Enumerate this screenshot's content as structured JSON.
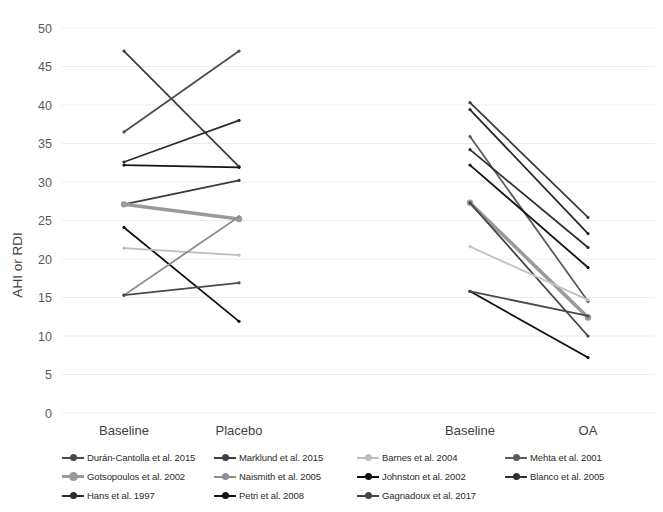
{
  "chart_data": {
    "type": "line",
    "title": "",
    "xlabel": "",
    "ylabel": "AHI or RDI",
    "ylim": [
      0,
      50
    ],
    "yticks": [
      0,
      5,
      10,
      15,
      20,
      25,
      30,
      35,
      40,
      45,
      50
    ],
    "grid": true,
    "legend_position": "bottom",
    "categories": [
      "Baseline",
      "Placebo",
      "Baseline",
      "OA"
    ],
    "groups": [
      {
        "name": "Placebo comparison",
        "x_labels": [
          "Baseline",
          "Placebo"
        ],
        "series": [
          {
            "name": "Hans et al. 1997",
            "values": [
              47.0,
              32.0
            ],
            "color": "#3f3f3f",
            "width": 1.8,
            "marker": 3.2
          },
          {
            "name": "Marklund et al. 2015",
            "values": [
              36.5,
              47.0
            ],
            "color": "#4d4d4d",
            "width": 1.8,
            "marker": 3.2
          },
          {
            "name": "Mehta et al. 2001",
            "values": [
              32.6,
              38.0
            ],
            "color": "#2e2e2e",
            "width": 1.8,
            "marker": 3.2
          },
          {
            "name": "Petri et al. 2008",
            "values": [
              32.2,
              31.9
            ],
            "color": "#151515",
            "width": 1.8,
            "marker": 3.2
          },
          {
            "name": "Blanco et al. 2005",
            "values": [
              27.1,
              30.2
            ],
            "color": "#3a3a3a",
            "width": 1.8,
            "marker": 3.2
          },
          {
            "name": "Gotsopoulos et al. 2002",
            "values": [
              27.1,
              25.2
            ],
            "color": "#9a9a9a",
            "width": 3.6,
            "marker": 6.4
          },
          {
            "name": "Johnston et al. 2002",
            "values": [
              24.1,
              11.9
            ],
            "color": "#101010",
            "width": 1.8,
            "marker": 3.2
          },
          {
            "name": "Barnes et al. 2004",
            "values": [
              21.4,
              20.5
            ],
            "color": "#bdbdbd",
            "width": 1.8,
            "marker": 3.2
          },
          {
            "name": "Naismith et al. 2005",
            "values": [
              15.3,
              25.5
            ],
            "color": "#8e8e8e",
            "width": 1.8,
            "marker": 3.2
          },
          {
            "name": "Durán-Cantolla et al. 2015",
            "values": [
              15.3,
              16.9
            ],
            "color": "#4a4a4a",
            "width": 1.8,
            "marker": 3.2
          }
        ]
      },
      {
        "name": "Oral appliance comparison",
        "x_labels": [
          "Baseline",
          "OA"
        ],
        "series": [
          {
            "name": "Marklund et al. 2015",
            "values": [
              40.3,
              25.4
            ],
            "color": "#3f3f3f",
            "width": 1.8,
            "marker": 3.2
          },
          {
            "name": "Hans et al. 1997",
            "values": [
              39.4,
              23.3
            ],
            "color": "#2b2b2b",
            "width": 1.8,
            "marker": 3.2
          },
          {
            "name": "Mehta et al. 2001",
            "values": [
              35.9,
              14.5
            ],
            "color": "#5c5c5c",
            "width": 1.8,
            "marker": 3.2
          },
          {
            "name": "Blanco et al. 2005",
            "values": [
              34.2,
              21.5
            ],
            "color": "#303030",
            "width": 1.8,
            "marker": 3.2
          },
          {
            "name": "Petri et al. 2008",
            "values": [
              32.2,
              18.9
            ],
            "color": "#151515",
            "width": 1.8,
            "marker": 3.2
          },
          {
            "name": "Gotsopoulos et al. 2002",
            "values": [
              27.3,
              12.4
            ],
            "color": "#9a9a9a",
            "width": 3.6,
            "marker": 6.4
          },
          {
            "name": "Gagnadoux et al. 2017",
            "values": [
              27.3,
              10.0
            ],
            "color": "#454545",
            "width": 1.8,
            "marker": 3.2
          },
          {
            "name": "Barnes et al. 2004",
            "values": [
              21.6,
              14.7
            ],
            "color": "#c2c2c2",
            "width": 1.8,
            "marker": 3.2
          },
          {
            "name": "Johnston et al. 2002",
            "values": [
              15.8,
              7.2
            ],
            "color": "#101010",
            "width": 1.8,
            "marker": 3.2
          },
          {
            "name": "Durán-Cantolla et al. 2015",
            "values": [
              15.8,
              12.6
            ],
            "color": "#4a4a4a",
            "width": 1.8,
            "marker": 3.2
          }
        ]
      }
    ]
  },
  "axis": {
    "y_title": "AHI or RDI",
    "y_tick_labels": [
      "50",
      "45",
      "40",
      "35",
      "30",
      "25",
      "20",
      "15",
      "10",
      "5",
      "0"
    ],
    "x_tick_labels": [
      {
        "label": "Baseline",
        "x": 124
      },
      {
        "label": "Placebo",
        "x": 239
      },
      {
        "label": "Baseline",
        "x": 470
      },
      {
        "label": "OA",
        "x": 588
      }
    ]
  },
  "legend": {
    "columns": [
      [
        {
          "label": "Durán-Cantolla et al. 2015",
          "color": "#4a4a4a",
          "marker_size": "small"
        },
        {
          "label": "Gotsopoulos et al. 2002",
          "color": "#9a9a9a",
          "marker_size": "large"
        },
        {
          "label": "Hans et al. 1997",
          "color": "#2b2b2b",
          "marker_size": "small"
        }
      ],
      [
        {
          "label": "Marklund et al. 2015",
          "color": "#3f3f3f",
          "marker_size": "small"
        },
        {
          "label": "Naismith et al. 2005",
          "color": "#8e8e8e",
          "marker_size": "small"
        },
        {
          "label": "Petri et al. 2008",
          "color": "#151515",
          "marker_size": "small"
        }
      ],
      [
        {
          "label": "Barnes et al. 2004",
          "color": "#bdbdbd",
          "marker_size": "small"
        },
        {
          "label": "Johnston et al. 2002",
          "color": "#101010",
          "marker_size": "small"
        },
        {
          "label": "Gagnadoux et al. 2017",
          "color": "#454545",
          "marker_size": "small"
        }
      ],
      [
        {
          "label": "Mehta et al. 2001",
          "color": "#5c5c5c",
          "marker_size": "small"
        },
        {
          "label": "Blanco et al. 2005",
          "color": "#303030",
          "marker_size": "small"
        }
      ]
    ]
  },
  "colors": {
    "background": "#ffffff",
    "gridline": "#ededed",
    "tick_text": "#595959",
    "category_text": "#3f3f3f"
  }
}
